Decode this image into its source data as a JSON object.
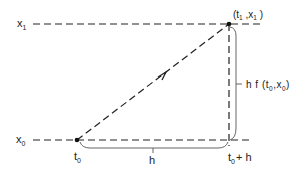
{
  "diagram": {
    "type": "euler-step-geometry",
    "colors": {
      "stroke": "#222222",
      "background": "#ffffff"
    },
    "lines": {
      "x1_level": {
        "label": "x",
        "sub": "1"
      },
      "x0_level": {
        "label": "x",
        "sub": "0"
      }
    },
    "points": {
      "start": {
        "t": "t",
        "t_sub": "0"
      },
      "end": {
        "label_open": "(t",
        "t_sub": "1",
        "sep": " ,x",
        "x_sub": "1",
        "label_close": " )"
      }
    },
    "braces": {
      "horizontal": {
        "label": "h"
      },
      "vertical": {
        "prefix": "h f (t",
        "t_sub": "0",
        "mid": ",x",
        "x_sub": "0",
        "close": ")"
      }
    },
    "axis_labels": {
      "t0": {
        "base": "t",
        "sub": "0"
      },
      "t0_plus_h": {
        "base": "t",
        "sub": "0",
        "suffix": "+ h"
      }
    }
  }
}
